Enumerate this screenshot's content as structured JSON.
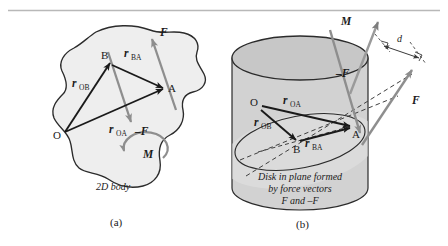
{
  "figure": {
    "title_rule": "top-hairline",
    "colors": {
      "body_fill": "#efefef",
      "body_stroke": "#2b2b2b",
      "cylinder_side_fill": "#d3d3d3",
      "cylinder_top_fill": "#c9c9c9",
      "disk_fill": "#e4e4e4",
      "vector_black": "#1a1a1a",
      "vector_gray": "#8e8e8e",
      "dashed_gray": "#4a4a4a",
      "rule_gray": "#b5b5b5",
      "text": "#1a1a1a"
    },
    "panel_a": {
      "caption": "(a)",
      "body_label": "2D body",
      "points": [
        {
          "name": "O",
          "label": "O",
          "x": 63,
          "y": 134
        },
        {
          "name": "B",
          "label": "B",
          "x": 111,
          "y": 61
        },
        {
          "name": "A",
          "label": "A",
          "x": 166,
          "y": 88
        }
      ],
      "vectors": [
        {
          "name": "r_OB",
          "label": "r",
          "sub": "OB",
          "from": "O",
          "to": "B",
          "color": "black"
        },
        {
          "name": "r_OA",
          "label": "r",
          "sub": "OA",
          "from": "O",
          "to": "A",
          "color": "black"
        },
        {
          "name": "r_BA",
          "label": "r",
          "sub": "BA",
          "from": "B",
          "to": "A",
          "color": "black"
        },
        {
          "name": "F",
          "label": "F",
          "sub": "",
          "from": "A",
          "to": "up-right",
          "color": "gray"
        },
        {
          "name": "minus_F",
          "label": "–F",
          "sub": "",
          "from": "B",
          "to": "down-right",
          "color": "gray"
        }
      ],
      "moment": {
        "label": "M",
        "sense": "counterclockwise"
      }
    },
    "panel_b": {
      "caption": "(b)",
      "disk_caption_lines": [
        "Disk in plane formed",
        "by force vectors",
        "F and –F"
      ],
      "points": [
        {
          "name": "O",
          "label": "O",
          "x": 256,
          "y": 106
        },
        {
          "name": "B",
          "label": "B",
          "x": 298,
          "y": 143
        },
        {
          "name": "A",
          "label": "A",
          "x": 350,
          "y": 128
        }
      ],
      "vectors": [
        {
          "name": "r_OA",
          "label": "r",
          "sub": "OA",
          "from": "O",
          "to": "A",
          "color": "black"
        },
        {
          "name": "r_OB",
          "label": "r",
          "sub": "OB",
          "from": "O",
          "to": "B",
          "color": "black"
        },
        {
          "name": "r_BA",
          "label": "r",
          "sub": "BA",
          "from": "B",
          "to": "A",
          "color": "black"
        },
        {
          "name": "F",
          "label": "F",
          "sub": "",
          "color": "gray"
        },
        {
          "name": "minus_F",
          "label": "–F",
          "sub": "",
          "color": "gray"
        },
        {
          "name": "M",
          "label": "M",
          "sub": "",
          "color": "gray"
        }
      ],
      "dimension": {
        "name": "d",
        "label": "d",
        "description": "perpendicular distance between force lines of action"
      }
    }
  }
}
